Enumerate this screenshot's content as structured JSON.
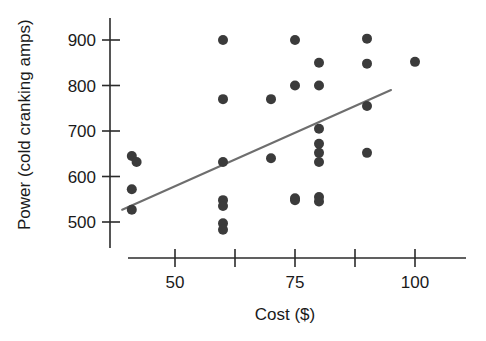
{
  "chart_data": {
    "type": "scatter",
    "title": "",
    "subtitle": "",
    "xlabel": "Cost ($)",
    "ylabel": "Power (cold cranking amps)",
    "xlim": [
      36,
      106
    ],
    "ylim": [
      460,
      930
    ],
    "grid": false,
    "legend": false,
    "legend_position": "none",
    "x_ticks": [
      50,
      62.5,
      75,
      87.5,
      100
    ],
    "x_tick_labels": [
      "50",
      "",
      "75",
      "",
      "100"
    ],
    "y_ticks": [
      500,
      600,
      700,
      800,
      900
    ],
    "y_tick_labels": [
      "500",
      "600",
      "700",
      "800",
      "900"
    ],
    "marker_color": "#3b3b3b",
    "line_color": "#6e6e6e",
    "axis_color": "#2b2b2b",
    "points": [
      {
        "x": 41,
        "y": 645
      },
      {
        "x": 42,
        "y": 632
      },
      {
        "x": 41,
        "y": 572
      },
      {
        "x": 41,
        "y": 527
      },
      {
        "x": 60,
        "y": 900
      },
      {
        "x": 60,
        "y": 770
      },
      {
        "x": 60,
        "y": 632
      },
      {
        "x": 60,
        "y": 548
      },
      {
        "x": 60,
        "y": 535
      },
      {
        "x": 60,
        "y": 497
      },
      {
        "x": 60,
        "y": 483
      },
      {
        "x": 70,
        "y": 770
      },
      {
        "x": 70,
        "y": 640
      },
      {
        "x": 75,
        "y": 900
      },
      {
        "x": 75,
        "y": 800
      },
      {
        "x": 75,
        "y": 552
      },
      {
        "x": 75,
        "y": 548
      },
      {
        "x": 80,
        "y": 850
      },
      {
        "x": 80,
        "y": 800
      },
      {
        "x": 80,
        "y": 705
      },
      {
        "x": 80,
        "y": 672
      },
      {
        "x": 80,
        "y": 652
      },
      {
        "x": 80,
        "y": 632
      },
      {
        "x": 80,
        "y": 555
      },
      {
        "x": 80,
        "y": 545
      },
      {
        "x": 90,
        "y": 903
      },
      {
        "x": 90,
        "y": 848
      },
      {
        "x": 90,
        "y": 755
      },
      {
        "x": 90,
        "y": 652
      },
      {
        "x": 100,
        "y": 852
      }
    ],
    "trend_line": {
      "x_start": 39,
      "y_start": 527,
      "x_end": 95,
      "y_end": 790
    }
  },
  "axes": {
    "y_axis_name": "power-axis",
    "x_axis_name": "cost-axis"
  }
}
